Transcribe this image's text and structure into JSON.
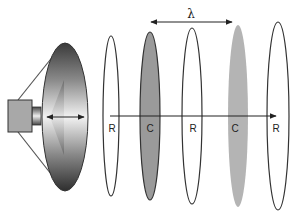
{
  "diagram": {
    "wavelength_symbol": "λ",
    "wavefronts": [
      {
        "label": "R",
        "type": "rarefaction",
        "cx": 111,
        "ry": 80,
        "fill": "none"
      },
      {
        "label": "C",
        "type": "compression",
        "cx": 150,
        "ry": 84,
        "fill": "#9a9a9a"
      },
      {
        "label": "R",
        "type": "rarefaction",
        "cx": 192,
        "ry": 88,
        "fill": "none"
      },
      {
        "label": "C",
        "type": "compression",
        "cx": 238,
        "ry": 91,
        "fill": "#b4b4b4"
      },
      {
        "label": "R",
        "type": "rarefaction",
        "cx": 278,
        "ry": 94,
        "fill": "none"
      }
    ],
    "colors": {
      "stroke": "#333333",
      "compression_dark": "#9a9a9a",
      "compression_light": "#b4b4b4",
      "speaker_box": "#a8a8a8"
    }
  }
}
